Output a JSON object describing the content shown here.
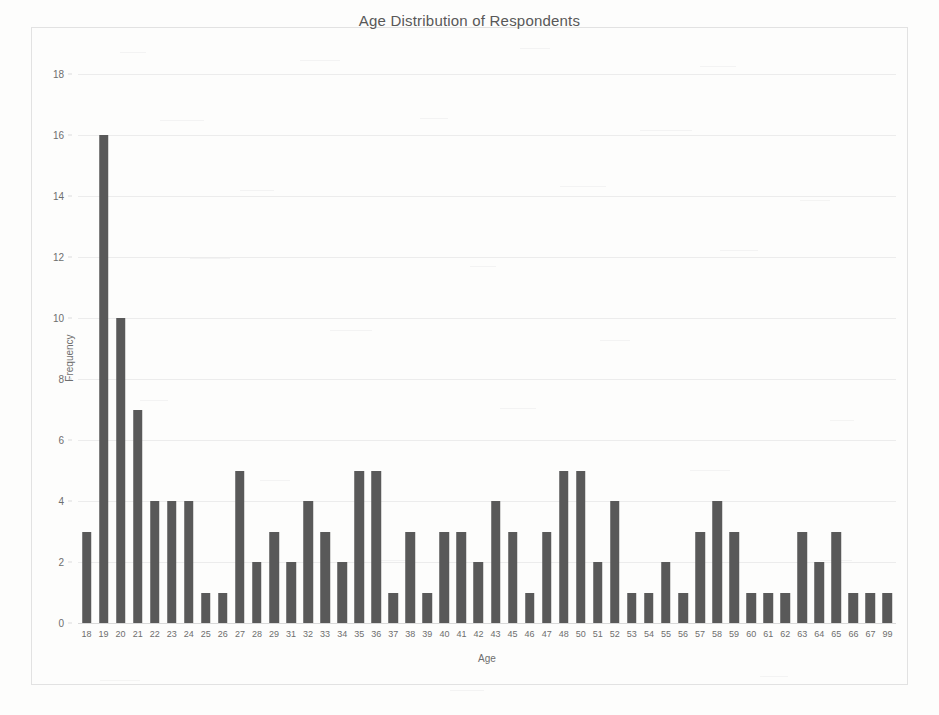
{
  "chart_data": {
    "type": "bar",
    "title": "Age Distribution of Respondents",
    "xlabel": "Age",
    "ylabel": "Frequency",
    "ylim": [
      0,
      18
    ],
    "ytick_step": 2,
    "yticks": [
      0,
      2,
      4,
      6,
      8,
      10,
      12,
      14,
      16,
      18
    ],
    "grid": true,
    "legend": false,
    "bar_color": "#595959",
    "categories": [
      "18",
      "19",
      "20",
      "21",
      "22",
      "23",
      "24",
      "25",
      "26",
      "27",
      "28",
      "29",
      "31",
      "32",
      "33",
      "34",
      "35",
      "36",
      "37",
      "38",
      "39",
      "40",
      "41",
      "42",
      "43",
      "45",
      "46",
      "47",
      "48",
      "50",
      "51",
      "52",
      "53",
      "54",
      "55",
      "56",
      "57",
      "58",
      "59",
      "60",
      "61",
      "62",
      "63",
      "64",
      "65",
      "66",
      "67",
      "99"
    ],
    "values": [
      3,
      16,
      10,
      7,
      4,
      4,
      4,
      1,
      1,
      5,
      2,
      3,
      2,
      4,
      3,
      2,
      5,
      5,
      1,
      3,
      1,
      3,
      3,
      2,
      4,
      3,
      1,
      3,
      5,
      5,
      2,
      4,
      1,
      1,
      2,
      1,
      3,
      4,
      3,
      1,
      1,
      1,
      3,
      2,
      3,
      1,
      1,
      1
    ]
  }
}
